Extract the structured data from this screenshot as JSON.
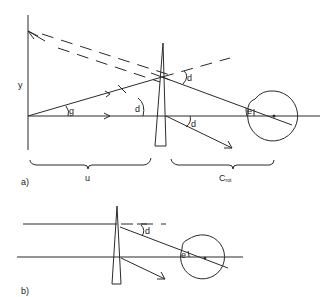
{
  "diagram": {
    "panel_a": {
      "panel_label": "a)",
      "labels": {
        "y": "y",
        "g": "g",
        "d_prism": "d",
        "d_upper": "d",
        "d_lower": "d",
        "e": "e",
        "u": "u",
        "c_main": "C",
        "c_sub": "rot"
      }
    },
    "panel_b": {
      "panel_label": "b)",
      "labels": {
        "d": "d",
        "e": "e"
      }
    },
    "colors": {
      "line": "#2a2a2a",
      "background": "#ffffff"
    }
  }
}
